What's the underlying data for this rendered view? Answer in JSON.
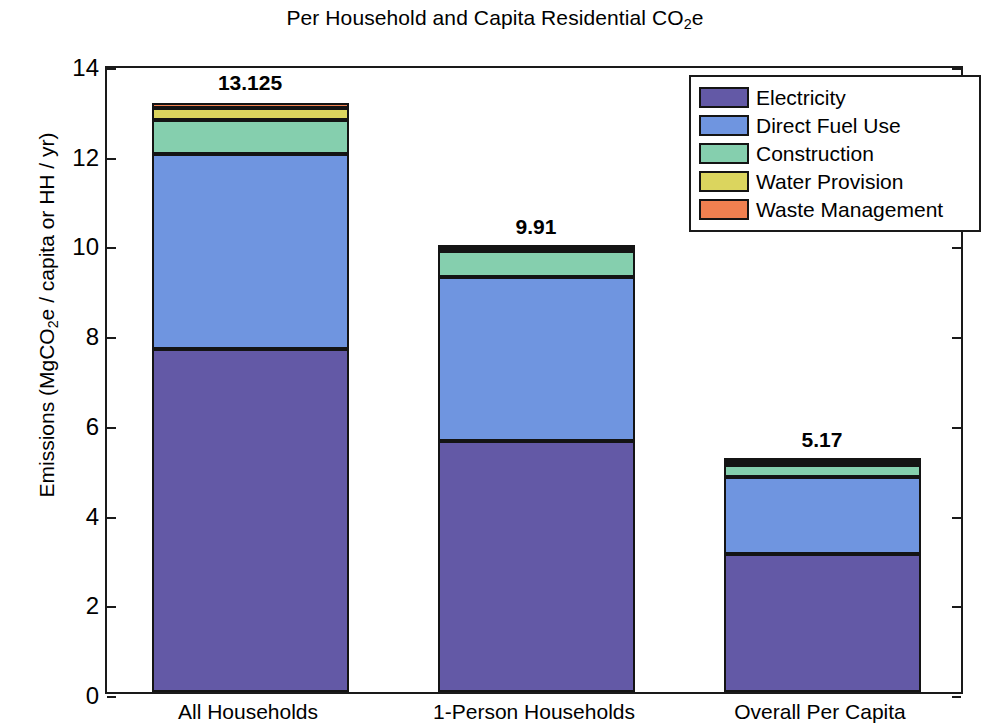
{
  "chart_data": {
    "type": "bar",
    "subtype": "stacked",
    "title": "Per Household and Capita Residential CO2e",
    "title_parts": {
      "pre": "Per Household and Capita Residential CO",
      "sub": "2",
      "post": "e"
    },
    "xlabel": "",
    "ylabel": "Emissions (MgCO2e / capita or HH / yr)",
    "ylabel_parts": {
      "pre": "Emissions (MgCO",
      "sub": "2",
      "post": "e / capita or HH / yr)"
    },
    "ylim": [
      0,
      14
    ],
    "ytick_step": 2,
    "yticks": [
      0,
      2,
      4,
      6,
      8,
      10,
      12,
      14
    ],
    "ytick_labels": [
      "0",
      "2",
      "4",
      "6",
      "8",
      "10",
      "12",
      "14"
    ],
    "grid": false,
    "legend_position": "upper right",
    "categories": [
      "All Households",
      "1-Person Households",
      "Overall Per Capita"
    ],
    "totals": [
      13.125,
      9.91,
      5.17
    ],
    "total_labels": [
      "13.125",
      "9.91",
      "5.17"
    ],
    "series": [
      {
        "name": "Electricity",
        "color": "#6359a6",
        "values": [
          7.65,
          5.6,
          3.08
        ]
      },
      {
        "name": "Direct Fuel Use",
        "color": "#6f95e0",
        "values": [
          4.35,
          3.65,
          1.72
        ]
      },
      {
        "name": "Construction",
        "color": "#85cfae",
        "values": [
          0.76,
          0.58,
          0.27
        ]
      },
      {
        "name": "Water Provision",
        "color": "#dbd55e",
        "values": [
          0.26,
          0.05,
          0.06
        ]
      },
      {
        "name": "Waste Management",
        "color": "#f08050",
        "values": [
          0.105,
          0.03,
          0.04
        ]
      }
    ]
  },
  "legend": {
    "items": [
      {
        "label": "Electricity",
        "color": "#6359a6"
      },
      {
        "label": "Direct Fuel Use",
        "color": "#6f95e0"
      },
      {
        "label": "Construction",
        "color": "#85cfae"
      },
      {
        "label": "Water Provision",
        "color": "#dbd55e"
      },
      {
        "label": "Waste Management",
        "color": "#f08050"
      }
    ]
  },
  "colors": {
    "axis": "#1a1a1a",
    "bar_outline": "#141414",
    "background": "#ffffff"
  }
}
